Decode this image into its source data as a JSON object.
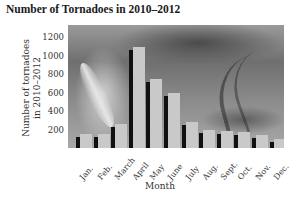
{
  "chart_data": {
    "type": "bar",
    "title": "Number of Tornadoes in 2010–2012",
    "xlabel": "Month",
    "ylabel": "Number of tornadoes in 2010–2012",
    "ylabel_lines": [
      "Number of tornadoes",
      "in 2010–2012"
    ],
    "categories": [
      "Jan.",
      "Feb.",
      "March",
      "April",
      "May",
      "June",
      "July",
      "Aug.",
      "Sept.",
      "Oct.",
      "Nov.",
      "Dec."
    ],
    "values": [
      150,
      150,
      260,
      1090,
      745,
      595,
      280,
      195,
      185,
      175,
      140,
      100
    ],
    "yticks": [
      200,
      400,
      600,
      800,
      1000,
      1200
    ],
    "ylim": [
      0,
      1330
    ],
    "grid": false,
    "legend": null,
    "background": "tornado photograph (grayscale)"
  },
  "colors": {
    "bar": "#c9c9c9",
    "bar_shadow": "#111111",
    "text": "#333333"
  }
}
